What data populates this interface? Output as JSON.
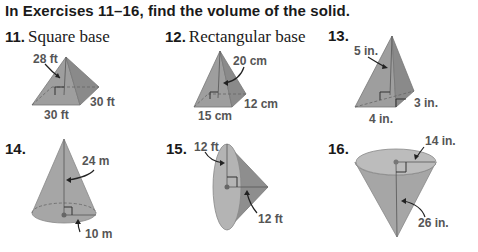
{
  "heading": "In Exercises 11–16, find the volume of the solid.",
  "exercises": [
    {
      "number": "11.",
      "caption": "Square base",
      "shape": "square-pyramid",
      "labels": [
        "28 ft",
        "30 ft",
        "30 ft"
      ]
    },
    {
      "number": "12.",
      "caption": "Rectangular base",
      "shape": "rectangular-pyramid",
      "labels": [
        "20 cm",
        "12 cm",
        "15 cm"
      ]
    },
    {
      "number": "13.",
      "caption": "",
      "shape": "rectangular-pyramid",
      "labels": [
        "5 in.",
        "3 in.",
        "4 in."
      ]
    },
    {
      "number": "14.",
      "caption": "",
      "shape": "cone",
      "labels": [
        "24 m",
        "10 m"
      ]
    },
    {
      "number": "15.",
      "caption": "",
      "shape": "cone-sideways",
      "labels": [
        "12 ft",
        "12 ft"
      ]
    },
    {
      "number": "16.",
      "caption": "",
      "shape": "inverted-cone",
      "labels": [
        "14 in.",
        "26 in."
      ]
    }
  ],
  "colors": {
    "solid_fill": "#a8a8a8",
    "solid_dark": "#8f8f8f",
    "label": "#555555",
    "text": "#1a1a1a"
  }
}
